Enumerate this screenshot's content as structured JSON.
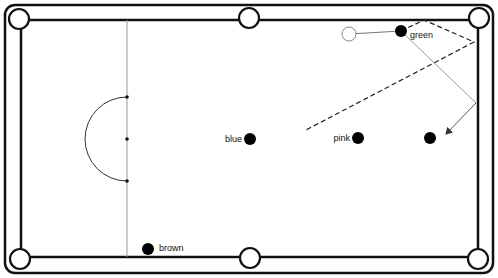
{
  "diagram": {
    "colors": {
      "background": "#ffffff",
      "line": "#111111",
      "thin_line": "#999999",
      "ball": "#000000"
    },
    "table": {
      "outer_frame": {
        "x": 5,
        "y": 5,
        "width": 488,
        "height": 268,
        "radius": 10
      },
      "cushion": {
        "left": 21,
        "top": 20,
        "right": 478,
        "bottom": 257
      },
      "pockets": [
        {
          "name": "top-left",
          "cx": 19,
          "cy": 19
        },
        {
          "name": "top-middle",
          "cx": 249,
          "cy": 18
        },
        {
          "name": "top-right",
          "cx": 479,
          "cy": 18
        },
        {
          "name": "bottom-left",
          "cx": 20,
          "cy": 259
        },
        {
          "name": "bottom-middle",
          "cx": 250,
          "cy": 258
        },
        {
          "name": "bottom-right",
          "cx": 478,
          "cy": 259
        }
      ],
      "pocket_radius": 10,
      "baulk_line_x": 127,
      "d_center": {
        "cx": 127,
        "cy": 139,
        "r": 42
      },
      "spots": [
        {
          "cx": 127,
          "cy": 97
        },
        {
          "cx": 127,
          "cy": 139
        },
        {
          "cx": 127,
          "cy": 181
        }
      ]
    },
    "balls": [
      {
        "name": "green",
        "label": "green",
        "cx": 401,
        "cy": 31,
        "label_x": 410,
        "label_y": 38,
        "label_anchor": "start"
      },
      {
        "name": "blue",
        "label": "blue",
        "cx": 250,
        "cy": 139,
        "label_x": 242,
        "label_y": 142,
        "label_anchor": "end"
      },
      {
        "name": "pink",
        "label": "pink",
        "cx": 358,
        "cy": 138,
        "label_x": 350,
        "label_y": 141,
        "label_anchor": "end"
      },
      {
        "name": "black",
        "label": "",
        "cx": 430,
        "cy": 138,
        "label_x": 0,
        "label_y": 0,
        "label_anchor": "start"
      },
      {
        "name": "brown",
        "label": "brown",
        "cx": 148,
        "cy": 249,
        "label_x": 159,
        "label_y": 251,
        "label_anchor": "start"
      }
    ],
    "ball_radius": 6,
    "cue_ball": {
      "cx": 349,
      "cy": 34,
      "r": 7
    },
    "paths": {
      "cue_line": "349,34 401,31",
      "object_path": "401,31 476,103",
      "rebound_arrow": {
        "x1": 476,
        "y1": 103,
        "x2": 446,
        "y2": 134
      },
      "dashed_path": "401,31 424,20 474,42 304,131"
    }
  }
}
